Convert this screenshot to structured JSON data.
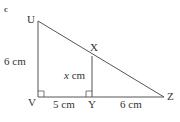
{
  "diagram": {
    "marker": "c",
    "points": {
      "U": "U",
      "V": "V",
      "X": "X",
      "Y": "Y",
      "Z": "Z"
    },
    "labels": {
      "UV": "6 cm",
      "XY_var": "x",
      "XY_unit": " cm",
      "VY": "5 cm",
      "YZ": "6 cm"
    },
    "right_angles": [
      "V",
      "Y"
    ],
    "colors": {
      "line": "#555555",
      "text": "#333333"
    }
  }
}
